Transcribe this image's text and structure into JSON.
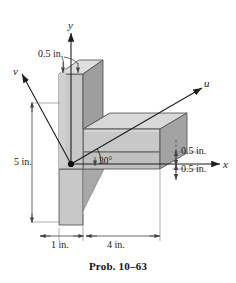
{
  "figure": {
    "caption": "Prob. 10–63",
    "axes": {
      "y_label": "y",
      "x_label": "x",
      "u_label": "u",
      "v_label": "v"
    },
    "angle": {
      "value": "30°",
      "between": "u-axis and x-axis"
    },
    "dimensions": {
      "web_thickness_top": "0.5 in.",
      "flange_thickness_upper": "0.5 in.",
      "flange_thickness_lower": "0.5 in.",
      "web_height": "5 in.",
      "web_width": "1 in.",
      "flange_length": "4 in."
    },
    "colors": {
      "face_front": "#c8c8c8",
      "face_top": "#d9d9d9",
      "face_side_dark": "#9e9e9e",
      "face_side_mid": "#b4b4b4",
      "outline": "#4a4a4a",
      "axis_line": "#1e1e1e",
      "dim_line": "#555555",
      "background": "#ffffff"
    },
    "icons": {
      "origin": "origin-dot",
      "arrow": "arrowhead"
    }
  }
}
